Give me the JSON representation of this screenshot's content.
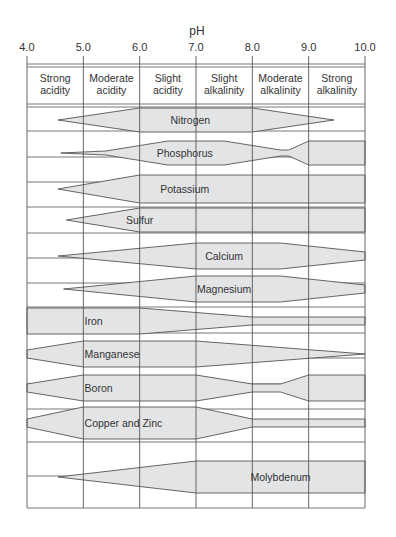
{
  "chart_data": {
    "type": "range-band",
    "title": "",
    "xlabel": "pH",
    "ylabel": "",
    "xlim": [
      4.0,
      10.0
    ],
    "x_ticks": [
      "4.0",
      "5.0",
      "6.0",
      "7.0",
      "8.0",
      "9.0",
      "10.0"
    ],
    "zones": [
      {
        "range": [
          4.0,
          5.0
        ],
        "label_lines": [
          "Strong",
          "acidity"
        ]
      },
      {
        "range": [
          5.0,
          6.0
        ],
        "label_lines": [
          "Moderate",
          "acidity"
        ]
      },
      {
        "range": [
          6.0,
          7.0
        ],
        "label_lines": [
          "Slight",
          "acidity"
        ]
      },
      {
        "range": [
          7.0,
          8.0
        ],
        "label_lines": [
          "Slight",
          "alkalinity"
        ]
      },
      {
        "range": [
          8.0,
          9.0
        ],
        "label_lines": [
          "Moderate",
          "alkalinity"
        ]
      },
      {
        "range": [
          9.0,
          10.0
        ],
        "label_lines": [
          "Strong",
          "alkalinity"
        ]
      }
    ],
    "grid": true,
    "legend": "none",
    "fill_color": "#e3e4e6",
    "stroke_color": "#555555",
    "series": [
      {
        "name": "Nitrogen",
        "label_x": 6.9,
        "center_y": 120,
        "profile": [
          [
            4.55,
            0
          ],
          [
            6.0,
            12
          ],
          [
            8.0,
            12
          ],
          [
            9.45,
            0
          ]
        ]
      },
      {
        "name": "Phosphorus",
        "label_x": 6.8,
        "center_y": 153,
        "profile": [
          [
            4.6,
            0
          ],
          [
            5.4,
            2
          ],
          [
            6.5,
            12
          ],
          [
            7.5,
            12
          ],
          [
            8.5,
            3
          ],
          [
            8.65,
            3
          ],
          [
            9.0,
            12
          ],
          [
            10.0,
            12
          ]
        ]
      },
      {
        "name": "Potassium",
        "label_x": 6.8,
        "center_y": 189,
        "profile": [
          [
            4.55,
            0
          ],
          [
            6.0,
            14
          ],
          [
            10.0,
            14
          ]
        ]
      },
      {
        "name": "Sulfur",
        "label_x": 6.0,
        "center_y": 220,
        "profile": [
          [
            4.7,
            0
          ],
          [
            6.0,
            12
          ],
          [
            10.0,
            12
          ]
        ]
      },
      {
        "name": "Calcium",
        "label_x": 7.5,
        "center_y": 256,
        "profile": [
          [
            4.55,
            0
          ],
          [
            7.0,
            13
          ],
          [
            8.5,
            13
          ],
          [
            10.0,
            4
          ]
        ]
      },
      {
        "name": "Magnesium",
        "label_x": 7.5,
        "center_y": 289,
        "profile": [
          [
            4.65,
            0
          ],
          [
            7.0,
            13
          ],
          [
            8.5,
            13
          ],
          [
            10.0,
            4
          ]
        ]
      },
      {
        "name": "Iron",
        "label_x": 5.2,
        "center_y": 321,
        "profile": [
          [
            4.0,
            13
          ],
          [
            6.0,
            13
          ],
          [
            8.0,
            4
          ],
          [
            10.0,
            4
          ]
        ]
      },
      {
        "name": "Manganese",
        "label_x": 5.2,
        "center_y": 354,
        "profile": [
          [
            4.0,
            4
          ],
          [
            5.0,
            13
          ],
          [
            7.0,
            13
          ],
          [
            10.0,
            0
          ]
        ]
      },
      {
        "name": "Boron",
        "label_x": 5.2,
        "center_y": 388,
        "profile": [
          [
            4.0,
            4
          ],
          [
            5.0,
            13
          ],
          [
            7.0,
            13
          ],
          [
            8.0,
            4
          ],
          [
            8.5,
            4
          ],
          [
            9.0,
            13
          ],
          [
            10.0,
            13
          ]
        ]
      },
      {
        "name": "Copper and Zinc",
        "label_x": 5.2,
        "center_y": 423,
        "profile": [
          [
            4.0,
            4
          ],
          [
            5.0,
            16
          ],
          [
            7.0,
            16
          ],
          [
            8.0,
            4
          ],
          [
            10.0,
            4
          ]
        ]
      },
      {
        "name": "Molybdenum",
        "label_x": 8.5,
        "center_y": 477,
        "profile": [
          [
            4.55,
            0
          ],
          [
            7.0,
            16
          ],
          [
            10.0,
            16
          ]
        ]
      }
    ]
  }
}
